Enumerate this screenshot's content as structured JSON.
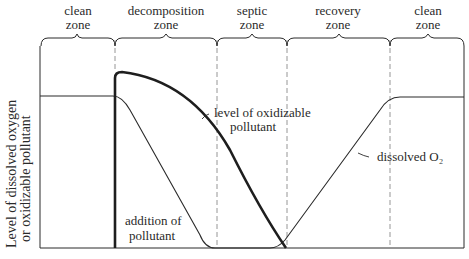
{
  "diagram": {
    "y_axis_label_lines": [
      "Level of dissolved oxygen",
      "or oxidizable pollutant"
    ],
    "zones": [
      {
        "line1": "clean",
        "line2": "zone"
      },
      {
        "line1": "decomposition",
        "line2": "zone"
      },
      {
        "line1": "septic",
        "line2": "zone"
      },
      {
        "line1": "recovery",
        "line2": "zone"
      },
      {
        "line1": "clean",
        "line2": "zone"
      }
    ],
    "annotations": {
      "pollutant_curve": [
        "level of oxidizable",
        "pollutant"
      ],
      "oxygen_curve": "dissolved O₂",
      "addition": [
        "addition of",
        "pollutant"
      ]
    },
    "colors": {
      "ink": "#2a2a2a",
      "divider": "#8a8a8a",
      "background": "#ffffff"
    }
  }
}
